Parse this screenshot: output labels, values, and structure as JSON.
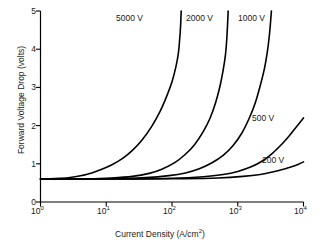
{
  "chart_data": {
    "type": "line",
    "title": "",
    "xlabel": "Current Density (A/cm2)",
    "xlabel_base": "Current Density (A/cm",
    "xlabel_sup": "2",
    "xlabel_tail": ")",
    "ylabel": "Forward Voltage Drop (volts)",
    "xscale": "log",
    "yscale": "linear",
    "xlim": [
      1,
      10000
    ],
    "ylim": [
      0,
      5
    ],
    "grid": false,
    "legend_position": "inline-curve-labels",
    "xticks": [
      1,
      10,
      100,
      1000,
      10000
    ],
    "xtick_labels": [
      "10^0",
      "10^1",
      "10^2",
      "10^3",
      "10^4"
    ],
    "xtick_mantissa": [
      "10",
      "10",
      "10",
      "10",
      "10"
    ],
    "xtick_exponents": [
      "0",
      "1",
      "2",
      "3",
      "4"
    ],
    "yticks": [
      0,
      1,
      2,
      3,
      4,
      5
    ],
    "ytick_labels": [
      "0",
      "1",
      "2",
      "3",
      "4",
      "5"
    ],
    "series": [
      {
        "name": "5000 V",
        "label": "5000 V",
        "color": "#000000",
        "points": [
          [
            1,
            0.6
          ],
          [
            2,
            0.62
          ],
          [
            3,
            0.65
          ],
          [
            5,
            0.72
          ],
          [
            8,
            0.84
          ],
          [
            12,
            0.97
          ],
          [
            18,
            1.15
          ],
          [
            25,
            1.35
          ],
          [
            35,
            1.62
          ],
          [
            50,
            2.0
          ],
          [
            65,
            2.35
          ],
          [
            80,
            2.7
          ],
          [
            100,
            3.15
          ],
          [
            115,
            3.55
          ],
          [
            125,
            3.9
          ],
          [
            130,
            4.2
          ],
          [
            135,
            4.6
          ],
          [
            138,
            5.0
          ]
        ]
      },
      {
        "name": "2000 V",
        "label": "2000 V",
        "color": "#000000",
        "points": [
          [
            1,
            0.6
          ],
          [
            5,
            0.61
          ],
          [
            12,
            0.63
          ],
          [
            25,
            0.67
          ],
          [
            45,
            0.75
          ],
          [
            70,
            0.86
          ],
          [
            110,
            1.03
          ],
          [
            160,
            1.25
          ],
          [
            220,
            1.5
          ],
          [
            300,
            1.85
          ],
          [
            380,
            2.2
          ],
          [
            460,
            2.6
          ],
          [
            540,
            3.05
          ],
          [
            600,
            3.45
          ],
          [
            650,
            3.85
          ],
          [
            680,
            4.25
          ],
          [
            700,
            4.65
          ],
          [
            715,
            5.0
          ]
        ]
      },
      {
        "name": "1000 V",
        "label": "1000 V",
        "color": "#000000",
        "points": [
          [
            1,
            0.6
          ],
          [
            10,
            0.61
          ],
          [
            40,
            0.64
          ],
          [
            90,
            0.69
          ],
          [
            160,
            0.76
          ],
          [
            260,
            0.87
          ],
          [
            400,
            1.02
          ],
          [
            600,
            1.22
          ],
          [
            850,
            1.48
          ],
          [
            1150,
            1.8
          ],
          [
            1500,
            2.2
          ],
          [
            1850,
            2.6
          ],
          [
            2200,
            3.05
          ],
          [
            2550,
            3.5
          ],
          [
            2800,
            3.9
          ],
          [
            3000,
            4.3
          ],
          [
            3150,
            4.7
          ],
          [
            3250,
            5.0
          ]
        ]
      },
      {
        "name": "500 V",
        "label": "500 V",
        "color": "#000000",
        "points": [
          [
            1,
            0.6
          ],
          [
            20,
            0.605
          ],
          [
            100,
            0.62
          ],
          [
            300,
            0.66
          ],
          [
            600,
            0.72
          ],
          [
            1000,
            0.8
          ],
          [
            1600,
            0.92
          ],
          [
            2400,
            1.08
          ],
          [
            3400,
            1.28
          ],
          [
            4600,
            1.5
          ],
          [
            6000,
            1.72
          ],
          [
            7500,
            1.93
          ],
          [
            9000,
            2.1
          ],
          [
            10000,
            2.2
          ]
        ]
      },
      {
        "name": "200 V",
        "label": "200 V",
        "color": "#000000",
        "points": [
          [
            1,
            0.6
          ],
          [
            30,
            0.602
          ],
          [
            150,
            0.61
          ],
          [
            500,
            0.63
          ],
          [
            1200,
            0.67
          ],
          [
            2200,
            0.72
          ],
          [
            3500,
            0.79
          ],
          [
            5000,
            0.86
          ],
          [
            6800,
            0.93
          ],
          [
            8400,
            0.99
          ],
          [
            10000,
            1.05
          ]
        ]
      }
    ],
    "annotations": [
      {
        "text": "5000 V",
        "x_px": 116,
        "y_px": 13
      },
      {
        "text": "2000 V",
        "x_px": 186,
        "y_px": 13
      },
      {
        "text": "1000 V",
        "x_px": 238,
        "y_px": 13
      },
      {
        "text": "500 V",
        "x_px": 252,
        "y_px": 113
      },
      {
        "text": "200 V",
        "x_px": 262,
        "y_px": 155
      }
    ]
  }
}
